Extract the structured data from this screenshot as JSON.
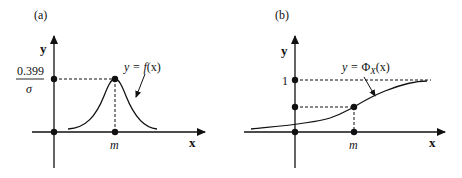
{
  "panels": [
    {
      "id": "a",
      "tag": "(a)",
      "y_axis_label": "y",
      "x_axis_label": "x",
      "x_marker": "m",
      "y_marker_numerator": "0.399",
      "y_marker_denominator": "σ",
      "curve_label_prefix": "y = ",
      "curve_label_func": "f",
      "curve_label_arg": "(x)",
      "curve": "normal probability density function"
    },
    {
      "id": "b",
      "tag": "(b)",
      "y_axis_label": "y",
      "x_axis_label": "x",
      "x_marker": "m",
      "y_marker_top": "1",
      "curve_label_prefix": "y = ",
      "curve_label_func": "Φ",
      "curve_label_sub": "X",
      "curve_label_arg": "(x)",
      "curve": "normal cumulative distribution function"
    }
  ],
  "colors": {
    "ink": "#111111",
    "background": "#ffffff"
  }
}
